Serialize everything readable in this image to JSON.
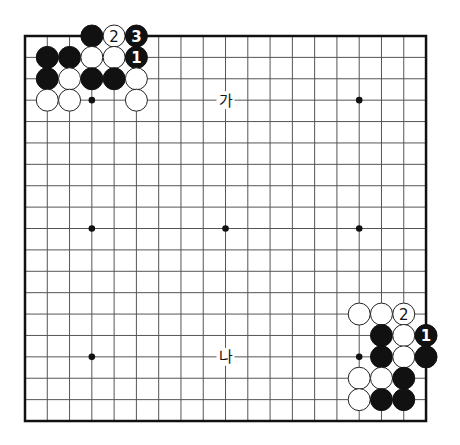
{
  "board": {
    "size": 19,
    "origin_x": 25,
    "origin_y": 36,
    "spacing_x": 22.28,
    "spacing_y": 21.39,
    "stone_radius": 11,
    "colors": {
      "black": "#111111",
      "white": "#ffffff",
      "line": "#555555",
      "border": "#111111"
    },
    "star_points": [
      [
        3,
        3
      ],
      [
        15,
        3
      ],
      [
        3,
        9
      ],
      [
        9,
        9
      ],
      [
        15,
        9
      ],
      [
        3,
        15
      ],
      [
        15,
        15
      ]
    ],
    "stones": [
      {
        "col": 3,
        "row": 0,
        "color": "black",
        "label": ""
      },
      {
        "col": 4,
        "row": 0,
        "color": "white",
        "label": "2"
      },
      {
        "col": 5,
        "row": 0,
        "color": "black",
        "label": "3"
      },
      {
        "col": 1,
        "row": 1,
        "color": "black",
        "label": ""
      },
      {
        "col": 2,
        "row": 1,
        "color": "black",
        "label": ""
      },
      {
        "col": 3,
        "row": 1,
        "color": "white",
        "label": ""
      },
      {
        "col": 4,
        "row": 1,
        "color": "white",
        "label": ""
      },
      {
        "col": 5,
        "row": 1,
        "color": "black",
        "label": "1"
      },
      {
        "col": 1,
        "row": 2,
        "color": "black",
        "label": ""
      },
      {
        "col": 2,
        "row": 2,
        "color": "white",
        "label": ""
      },
      {
        "col": 3,
        "row": 2,
        "color": "black",
        "label": ""
      },
      {
        "col": 4,
        "row": 2,
        "color": "black",
        "label": ""
      },
      {
        "col": 5,
        "row": 2,
        "color": "white",
        "label": ""
      },
      {
        "col": 1,
        "row": 3,
        "color": "white",
        "label": ""
      },
      {
        "col": 2,
        "row": 3,
        "color": "white",
        "label": ""
      },
      {
        "col": 5,
        "row": 3,
        "color": "white",
        "label": ""
      },
      {
        "col": 15,
        "row": 13,
        "color": "white",
        "label": ""
      },
      {
        "col": 16,
        "row": 13,
        "color": "white",
        "label": ""
      },
      {
        "col": 17,
        "row": 13,
        "color": "white",
        "label": "2"
      },
      {
        "col": 16,
        "row": 14,
        "color": "black",
        "label": ""
      },
      {
        "col": 17,
        "row": 14,
        "color": "white",
        "label": ""
      },
      {
        "col": 18,
        "row": 14,
        "color": "black",
        "label": "1"
      },
      {
        "col": 16,
        "row": 15,
        "color": "black",
        "label": ""
      },
      {
        "col": 17,
        "row": 15,
        "color": "white",
        "label": ""
      },
      {
        "col": 18,
        "row": 15,
        "color": "black",
        "label": ""
      },
      {
        "col": 15,
        "row": 16,
        "color": "white",
        "label": ""
      },
      {
        "col": 16,
        "row": 16,
        "color": "white",
        "label": ""
      },
      {
        "col": 17,
        "row": 16,
        "color": "black",
        "label": ""
      },
      {
        "col": 15,
        "row": 17,
        "color": "white",
        "label": ""
      },
      {
        "col": 16,
        "row": 17,
        "color": "black",
        "label": ""
      },
      {
        "col": 17,
        "row": 17,
        "color": "black",
        "label": ""
      }
    ],
    "point_labels": [
      {
        "col": 9,
        "row": 3,
        "text": "가"
      },
      {
        "col": 9,
        "row": 15,
        "text": "나"
      }
    ]
  }
}
